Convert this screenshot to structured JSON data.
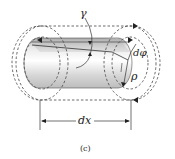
{
  "figure": {
    "type": "torsion-shaft-element",
    "labels": {
      "shear_strain": "γ",
      "twist_angle": "dφ",
      "radius": "ρ",
      "length": "dx"
    },
    "caption": "(c)",
    "colors": {
      "line": "#333333",
      "dashed": "#444444",
      "shaft_light": "#f2f2f2",
      "shaft_mid": "#cfcfcf",
      "shaft_dark": "#9a9a9a",
      "background": "#ffffff"
    }
  }
}
